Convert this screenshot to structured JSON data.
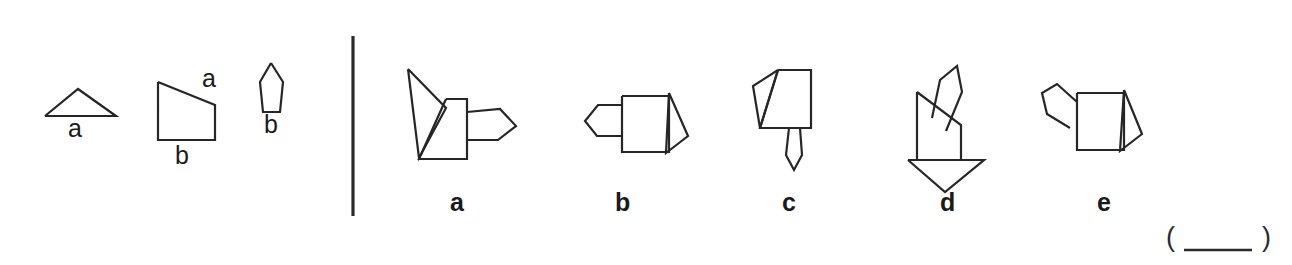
{
  "question": {
    "type": "spatial-reasoning-multiple-choice",
    "divider": {
      "orientation": "vertical",
      "x": 353,
      "y_top": 36,
      "y_bottom": 216
    },
    "reference_panel": {
      "name": "component-shapes",
      "shapes": [
        {
          "id": "ref-triangle",
          "icon": "triangle-icon",
          "label": "a",
          "label_position": "below",
          "label_x": 68,
          "label_y": 116,
          "points": "45,116 78,89 116,116 45,116"
        },
        {
          "id": "ref-trapezoid",
          "icon": "trapezoid-icon",
          "label_top": "a",
          "label_bottom": "b",
          "label_top_x": 202,
          "label_top_y": 66,
          "label_bottom_x": 175,
          "label_bottom_y": 143,
          "points": "158,82 215,105 215,140 158,140 158,82"
        },
        {
          "id": "ref-pentagon",
          "icon": "pentagon-icon",
          "label": "b",
          "label_position": "below",
          "label_x": 264,
          "label_y": 112,
          "points": "271,63 283,82 280,112 263,112 260,82 271,63"
        }
      ]
    },
    "options_panel": {
      "name": "answer-options",
      "options": [
        {
          "id": "option-a",
          "label": "a",
          "label_x": 450,
          "label_y": 190,
          "paths": [
            "M408,69 L446,108 L419,158 L408,69",
            "M446,99 L467,99 L467,159 L419,159 L446,99",
            "M467,112 L500,109 L516,126 L498,140 L467,140"
          ]
        },
        {
          "id": "option-b",
          "label": "b",
          "label_x": 615,
          "label_y": 190,
          "paths": [
            "M622,96 L669,96 L669,152 L622,152 L622,96",
            "M669,93 L688,136 L666,153 L669,93",
            "M622,105 L598,105 L585,121 L597,136 L622,136"
          ]
        },
        {
          "id": "option-c",
          "label": "c",
          "label_x": 782,
          "label_y": 190,
          "paths": [
            "M778,70 L811,70 L811,128 L760,128 L778,70",
            "M778,70 L753,86 L760,128 L778,70",
            "M789,128 L800,128 L802,155 L794,170 L786,155 L789,128"
          ]
        },
        {
          "id": "option-d",
          "label": "d",
          "label_x": 940,
          "label_y": 190,
          "paths": [
            "M917,92 L961,125 L961,160 L917,160 L917,92",
            "M932,118 L940,80 L957,66 L962,92 L946,131",
            "M908,160 L984,160 L945,192 L908,160"
          ]
        },
        {
          "id": "option-e",
          "label": "e",
          "label_x": 1097,
          "label_y": 190,
          "paths": [
            "M1077,93 L1124,93 L1124,150 L1077,150 L1077,93",
            "M1124,90 L1142,134 L1120,151 L1124,90",
            "M1077,102 L1057,84 L1042,93 L1047,114 L1070,128"
          ]
        }
      ]
    },
    "answer_blank": {
      "open_paren": "(",
      "close_paren": ")",
      "value": "",
      "paren_open_x": 1166,
      "paren_close_x": 1262,
      "paren_y": 224,
      "rule_x1": 1184,
      "rule_x2": 1252,
      "rule_y": 250
    }
  },
  "colors": {
    "background": "#ffffff",
    "ink": "#1a1a1a",
    "stroke": "#262626",
    "divider": "#2b2b2b"
  }
}
